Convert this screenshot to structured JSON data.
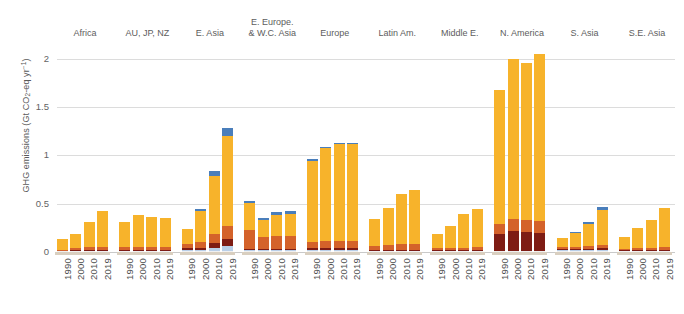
{
  "chart_data": {
    "type": "bar",
    "stacked": true,
    "title": "",
    "xlabel": "",
    "ylabel": "GHG emissions (Gt CO2-eq yr-1)",
    "ylabel_parts": {
      "prefix": "GHG emissions (Gt CO",
      "sub": "2",
      "mid": "-eq yr",
      "sup": "-1",
      "suffix": ")"
    },
    "ylim": [
      0,
      2.15
    ],
    "yticks": [
      0,
      0.5,
      1,
      1.5,
      2
    ],
    "ytick_labels": [
      "0",
      "0.5",
      "1",
      "1.5",
      "2"
    ],
    "grid": true,
    "legend": "none",
    "x": [
      "1990",
      "2000",
      "2010",
      "2019"
    ],
    "series": [
      {
        "name": "segment-1",
        "color": "#f0f0f0"
      },
      {
        "name": "segment-2",
        "color": "#b9cfe8"
      },
      {
        "name": "segment-3",
        "color": "#7e1c14"
      },
      {
        "name": "segment-4",
        "color": "#d4622a"
      },
      {
        "name": "segment-5",
        "color": "#f7b32b"
      },
      {
        "name": "segment-6",
        "color": "#4a7ebb"
      }
    ],
    "colors": {
      "pale": "#f2f2f2",
      "lightblue": "#b9cfe8",
      "darkred": "#7e1c14",
      "orange": "#d4622a",
      "yellow": "#f7b32b",
      "blue": "#4a7ebb",
      "gridline": "#dcdcdc",
      "baseline": "#d9cfc0",
      "text": "#5a5a5a"
    },
    "groups": [
      {
        "label": "Africa",
        "label_lines": [
          "Africa"
        ],
        "bars": [
          {
            "year": "1990",
            "total": 0.13,
            "segments": [
              0.004,
              0.0,
              0.0,
              0.012,
              0.114,
              0.0
            ]
          },
          {
            "year": "2000",
            "total": 0.175,
            "segments": [
              0.004,
              0.0,
              0.004,
              0.018,
              0.149,
              0.0
            ]
          },
          {
            "year": "2010",
            "total": 0.295,
            "segments": [
              0.005,
              0.0,
              0.005,
              0.028,
              0.257,
              0.0
            ]
          },
          {
            "year": "2019",
            "total": 0.415,
            "segments": [
              0.005,
              0.0,
              0.006,
              0.033,
              0.371,
              0.0
            ]
          }
        ]
      },
      {
        "label": "AU, JP, NZ",
        "label_lines": [
          "AU, JP, NZ"
        ],
        "bars": [
          {
            "year": "1990",
            "total": 0.305,
            "segments": [
              0.004,
              0.0,
              0.008,
              0.029,
              0.264,
              0.0
            ]
          },
          {
            "year": "2000",
            "total": 0.378,
            "segments": [
              0.004,
              0.0,
              0.009,
              0.036,
              0.329,
              0.0
            ]
          },
          {
            "year": "2010",
            "total": 0.355,
            "segments": [
              0.004,
              0.0,
              0.009,
              0.036,
              0.306,
              0.0
            ]
          },
          {
            "year": "2019",
            "total": 0.338,
            "segments": [
              0.004,
              0.0,
              0.008,
              0.034,
              0.292,
              0.0
            ]
          }
        ]
      },
      {
        "label": "E. Asia",
        "label_lines": [
          "E. Asia"
        ],
        "bars": [
          {
            "year": "1990",
            "total": 0.232,
            "segments": [
              0.006,
              0.006,
              0.016,
              0.049,
              0.155,
              0.0
            ]
          },
          {
            "year": "2000",
            "total": 0.443,
            "segments": [
              0.008,
              0.009,
              0.024,
              0.062,
              0.322,
              0.018
            ]
          },
          {
            "year": "2010",
            "total": 0.833,
            "segments": [
              0.01,
              0.03,
              0.05,
              0.097,
              0.6,
              0.046
            ]
          },
          {
            "year": "2019",
            "total": 1.285,
            "segments": [
              0.012,
              0.048,
              0.075,
              0.132,
              0.928,
              0.09
            ]
          }
        ]
      },
      {
        "label": "E. Europe. & W.C. Asia",
        "label_lines": [
          "E. Europe.",
          "& W.C. Asia"
        ],
        "bars": [
          {
            "year": "1990",
            "total": 0.518,
            "segments": [
              0.005,
              0.004,
              0.013,
              0.19,
              0.288,
              0.018
            ]
          },
          {
            "year": "2000",
            "total": 0.333,
            "segments": [
              0.004,
              0.003,
              0.01,
              0.12,
              0.178,
              0.018
            ]
          },
          {
            "year": "2010",
            "total": 0.402,
            "segments": [
              0.004,
              0.004,
              0.012,
              0.132,
              0.222,
              0.028
            ]
          },
          {
            "year": "2019",
            "total": 0.413,
            "segments": [
              0.004,
              0.004,
              0.012,
              0.136,
              0.228,
              0.029
            ]
          }
        ]
      },
      {
        "label": "Europe",
        "label_lines": [
          "Europe"
        ],
        "bars": [
          {
            "year": "1990",
            "total": 0.955,
            "segments": [
              0.006,
              0.004,
              0.018,
              0.07,
              0.837,
              0.02
            ]
          },
          {
            "year": "2000",
            "total": 1.075,
            "segments": [
              0.006,
              0.004,
              0.018,
              0.072,
              0.962,
              0.013
            ]
          },
          {
            "year": "2010",
            "total": 1.118,
            "segments": [
              0.006,
              0.004,
              0.018,
              0.074,
              1.003,
              0.013
            ]
          },
          {
            "year": "2019",
            "total": 1.118,
            "segments": [
              0.006,
              0.004,
              0.018,
              0.072,
              1.006,
              0.012
            ]
          }
        ]
      },
      {
        "label": "Latin Am.",
        "label_lines": [
          "Latin Am."
        ],
        "bars": [
          {
            "year": "1990",
            "total": 0.338,
            "segments": [
              0.005,
              0.0,
              0.008,
              0.046,
              0.279,
              0.0
            ]
          },
          {
            "year": "2000",
            "total": 0.447,
            "segments": [
              0.005,
              0.0,
              0.01,
              0.055,
              0.377,
              0.0
            ]
          },
          {
            "year": "2010",
            "total": 0.592,
            "segments": [
              0.006,
              0.0,
              0.012,
              0.062,
              0.512,
              0.0
            ]
          },
          {
            "year": "2019",
            "total": 0.635,
            "segments": [
              0.006,
              0.0,
              0.012,
              0.062,
              0.555,
              0.0
            ]
          }
        ]
      },
      {
        "label": "Middle E.",
        "label_lines": [
          "Middle E."
        ],
        "bars": [
          {
            "year": "1990",
            "total": 0.175,
            "segments": [
              0.003,
              0.0,
              0.004,
              0.016,
              0.152,
              0.0
            ]
          },
          {
            "year": "2000",
            "total": 0.252,
            "segments": [
              0.003,
              0.0,
              0.005,
              0.02,
              0.224,
              0.0
            ]
          },
          {
            "year": "2010",
            "total": 0.378,
            "segments": [
              0.004,
              0.0,
              0.006,
              0.026,
              0.342,
              0.0
            ]
          },
          {
            "year": "2019",
            "total": 0.435,
            "segments": [
              0.004,
              0.0,
              0.007,
              0.028,
              0.396,
              0.0
            ]
          }
        ]
      },
      {
        "label": "N. America",
        "label_lines": [
          "N. America"
        ],
        "bars": [
          {
            "year": "1990",
            "total": 1.672,
            "segments": [
              0.008,
              0.0,
              0.172,
              0.11,
              1.382,
              0.0
            ]
          },
          {
            "year": "2000",
            "total": 1.992,
            "segments": [
              0.008,
              0.0,
              0.205,
              0.126,
              1.653,
              0.0
            ]
          },
          {
            "year": "2010",
            "total": 1.95,
            "segments": [
              0.008,
              0.0,
              0.2,
              0.124,
              1.618,
              0.0
            ]
          },
          {
            "year": "2019",
            "total": 2.048,
            "segments": [
              0.008,
              0.0,
              0.183,
              0.128,
              1.729,
              0.0
            ]
          }
        ]
      },
      {
        "label": "S. Asia",
        "label_lines": [
          "S. Asia"
        ],
        "bars": [
          {
            "year": "1990",
            "total": 0.122,
            "segments": [
              0.004,
              0.003,
              0.006,
              0.016,
              0.093,
              0.0
            ]
          },
          {
            "year": "2000",
            "total": 0.188,
            "segments": [
              0.004,
              0.004,
              0.008,
              0.02,
              0.142,
              0.01
            ]
          },
          {
            "year": "2010",
            "total": 0.3,
            "segments": [
              0.005,
              0.006,
              0.012,
              0.026,
              0.231,
              0.02
            ]
          },
          {
            "year": "2019",
            "total": 0.455,
            "segments": [
              0.006,
              0.008,
              0.016,
              0.034,
              0.366,
              0.025
            ]
          }
        ]
      },
      {
        "label": "S.E. Asia",
        "label_lines": [
          "S.E. Asia"
        ],
        "bars": [
          {
            "year": "1990",
            "total": 0.14,
            "segments": [
              0.004,
              0.0,
              0.005,
              0.014,
              0.117,
              0.0
            ]
          },
          {
            "year": "2000",
            "total": 0.238,
            "segments": [
              0.004,
              0.0,
              0.007,
              0.02,
              0.207,
              0.0
            ]
          },
          {
            "year": "2010",
            "total": 0.325,
            "segments": [
              0.005,
              0.0,
              0.009,
              0.026,
              0.285,
              0.0
            ]
          },
          {
            "year": "2019",
            "total": 0.45,
            "segments": [
              0.005,
              0.0,
              0.011,
              0.032,
              0.402,
              0.0
            ]
          }
        ]
      }
    ]
  }
}
